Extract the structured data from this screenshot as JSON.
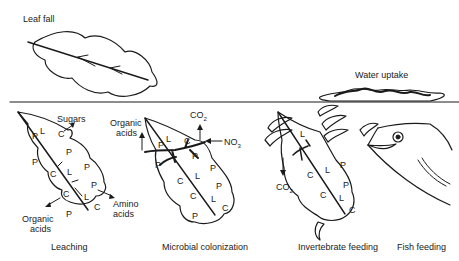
{
  "diagram": {
    "title_labels": {
      "leaf_fall": "Leaf fall",
      "water_uptake": "Water uptake"
    },
    "stages": [
      {
        "caption": "Leaching",
        "outputs": [
          "Sugars",
          "Amino acids",
          "Organic acids"
        ],
        "labels": {
          "sugars": "Sugars",
          "amino": "Amino",
          "amino2": "acids",
          "organic": "Organic",
          "organic2": "acids"
        }
      },
      {
        "caption": "Microbial colonization",
        "outputs": [
          "Organic acids",
          "CO2",
          "NO3"
        ],
        "labels": {
          "organic": "Organic",
          "organic2": "acids",
          "co2": "CO",
          "co2_sub": "2",
          "no3": "NO",
          "no3_sub": "3"
        }
      },
      {
        "caption": "Invertebrate feeding",
        "outputs": [
          "CO2"
        ],
        "labels": {
          "co2": "CO",
          "co2_sub": "2"
        }
      },
      {
        "caption": "Fish feeding"
      }
    ],
    "component_letters": {
      "P": "P",
      "L": "L",
      "C": "C"
    }
  }
}
